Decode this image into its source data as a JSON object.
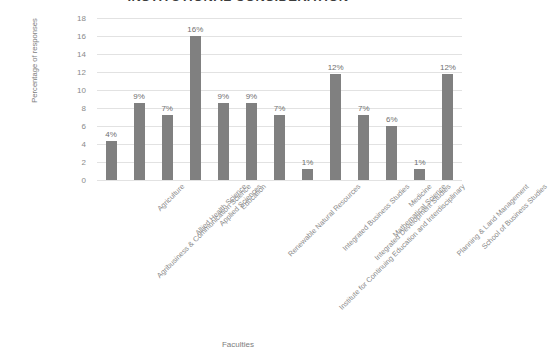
{
  "chart_data": {
    "type": "bar",
    "title": "INSTITUTIONAL CONSIDERATION",
    "xlabel": "Faculties",
    "ylabel": "Percentage of responses",
    "ylim": [
      0,
      18
    ],
    "yticks": [
      0,
      2,
      4,
      6,
      8,
      10,
      12,
      14,
      16,
      18
    ],
    "grid": true,
    "legend": "none",
    "bar_color": "#808080",
    "gridline_color": "#e2e2e2",
    "categories": [
      "Agribusiness & Communication Science",
      "Agriculture",
      "Allied Health Science",
      "Applied Sciences",
      "Education",
      "Renewable Natural Resources",
      "Institute for Continuing Education and Interdisciplinary",
      "Integrated Business Studies",
      "Integrated Development Studies",
      "Mathematical Science",
      "Medicine",
      "Planning & Land Management",
      "School of Business Studies"
    ],
    "values": [
      4.3,
      8.6,
      7.2,
      16.0,
      8.6,
      8.6,
      7.2,
      1.2,
      11.8,
      7.2,
      6.0,
      1.2,
      11.8
    ],
    "data_labels": [
      "4%",
      "9%",
      "7%",
      "16%",
      "9%",
      "9%",
      "7%",
      "1%",
      "12%",
      "7%",
      "6%",
      "1%",
      "12%"
    ]
  }
}
